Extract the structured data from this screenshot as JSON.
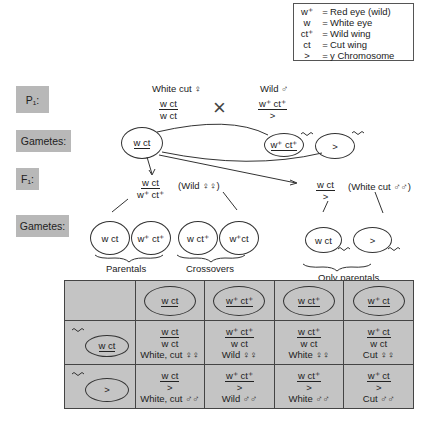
{
  "legend": {
    "rows": [
      {
        "symbol": "w⁺",
        "meaning": "Red eye (wild)"
      },
      {
        "symbol": "w",
        "meaning": "White eye"
      },
      {
        "symbol": "ct⁺",
        "meaning": "Wild wing"
      },
      {
        "symbol": "ct",
        "meaning": "Cut wing"
      },
      {
        "symbol": ">",
        "meaning": "y Chromosome"
      }
    ]
  },
  "stages": {
    "p1": "P₁:",
    "gametes1": "Gametes:",
    "f1": "F₁:",
    "gametes2": "Gametes:"
  },
  "p1": {
    "female_label": "White cut ♀",
    "female_num": "w ct",
    "female_den": "w ct",
    "cross": "×",
    "male_label": "Wild ♂",
    "male_num": "w⁺ ct⁺",
    "male_den": ">"
  },
  "gametes1": {
    "female": "w ct",
    "male_x": "w⁺ ct⁺",
    "male_y": ">"
  },
  "f1": {
    "female_num": "w ct",
    "female_den": "w⁺ ct⁺",
    "female_label": "(Wild ♀♀)",
    "male_num": "w ct",
    "male_den": ">",
    "male_label": "(White cut ♂♂)"
  },
  "gametes2": {
    "female": [
      "w ct",
      "w⁺ ct⁺",
      "w ct⁺",
      "w⁺ct"
    ],
    "male": [
      "w ct",
      ">"
    ],
    "parentals_label": "Parentals",
    "crossovers_label": "Crossovers",
    "only_parentals_label": "Only parentals"
  },
  "punnett": {
    "col_headers": [
      "w ct",
      "w⁺ ct⁺",
      "w ct⁺",
      "w⁺  ct"
    ],
    "row_headers": [
      "w ct",
      ">"
    ],
    "cells": [
      [
        {
          "num": "w ct",
          "den": "w ct",
          "phenotype": "White, cut ♀♀"
        },
        {
          "num": "w⁺ ct⁺",
          "den": "w ct",
          "phenotype": "Wild ♀♀"
        },
        {
          "num": "w ct⁺",
          "den": "w ct",
          "phenotype": "White ♀♀"
        },
        {
          "num": "w⁺ ct",
          "den": "w ct",
          "phenotype": "Cut  ♀♀"
        }
      ],
      [
        {
          "num": "w ct",
          "den": ">",
          "phenotype": "White, cut ♂♂"
        },
        {
          "num": "w⁺ ct⁺",
          "den": ">",
          "phenotype": "Wild ♂♂"
        },
        {
          "num": "w ct⁺",
          "den": ">",
          "phenotype": "White ♂♂"
        },
        {
          "num": "w⁺ ct",
          "den": ">",
          "phenotype": "Cut  ♂♂"
        }
      ]
    ]
  },
  "colors": {
    "stage_bg": "#b8b8b8",
    "table_bg": "#c4c4c4",
    "line": "#333333"
  }
}
